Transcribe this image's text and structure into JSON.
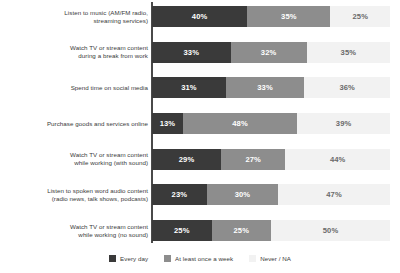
{
  "chart_data": {
    "type": "bar",
    "title": "",
    "subtitle": "",
    "xlabel": "",
    "ylabel": "",
    "orientation": "horizontal",
    "stacked": true,
    "stack_mode": "percent",
    "xlim": [
      0,
      100
    ],
    "grid": false,
    "legend_position": "bottom",
    "value_suffix": "%",
    "categories": [
      "Listen to music (AM/FM radio, streaming services)",
      "Watch TV or stream content during a break from work",
      "Spend time on social media",
      "Purchase goods and services online",
      "Watch TV or stream content while working (with sound)",
      "Listen to spoken word audio content (radio news, talk shows, podcasts)",
      "Watch TV or stream content while working (no sound)"
    ],
    "category_lines": [
      [
        "Listen to music (AM/FM radio,",
        "streaming services)"
      ],
      [
        "Watch TV or stream content",
        "during a break from work"
      ],
      [
        "Spend time on social media"
      ],
      [
        "Purchase goods and services online"
      ],
      [
        "Watch TV or stream content",
        "while working (with sound)"
      ],
      [
        "Listen to spoken word audio content",
        "(radio news, talk shows, podcasts)"
      ],
      [
        "Watch TV or stream content",
        "while working (no sound)"
      ]
    ],
    "series": [
      {
        "name": "Every day",
        "color": "#3a3a3a",
        "values": [
          40,
          33,
          31,
          13,
          29,
          23,
          25
        ],
        "labels": [
          "40%",
          "33%",
          "31%",
          "13%",
          "29%",
          "23%",
          "25%"
        ]
      },
      {
        "name": "At least once a week",
        "color": "#8d8d8d",
        "values": [
          35,
          32,
          33,
          48,
          27,
          30,
          25
        ],
        "labels": [
          "35%",
          "32%",
          "33%",
          "48%",
          "27%",
          "30%",
          "25%"
        ]
      },
      {
        "name": "Never / NA",
        "color": "#f2f2f2",
        "values": [
          25,
          35,
          36,
          39,
          44,
          47,
          50
        ],
        "labels": [
          "25%",
          "35%",
          "36%",
          "39%",
          "44%",
          "47%",
          "50%"
        ]
      }
    ]
  }
}
